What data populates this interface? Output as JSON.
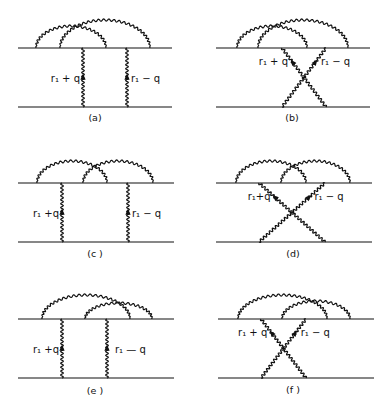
{
  "figure": {
    "panels": [
      {
        "id": "a",
        "caption": "(a)",
        "exchange": "direct",
        "label_left": "r₁ + q",
        "label_right": "r₁ − q",
        "arcs": "two nested overlapping arcs"
      },
      {
        "id": "b",
        "caption": "(b)",
        "exchange": "crossed",
        "label_left": "r₁ + q",
        "label_right": "r₁ − q",
        "arcs": "two nested overlapping arcs"
      },
      {
        "id": "c",
        "caption": "(c )",
        "exchange": "direct",
        "label_left": "r₁ +q",
        "label_right": "r₁ − q",
        "arcs": "two overlapping arcs side by side"
      },
      {
        "id": "d",
        "caption": "(d)",
        "exchange": "crossed",
        "label_left": "r₁+q",
        "label_right": "r₁ − q",
        "arcs": "two overlapping arcs side by side"
      },
      {
        "id": "e",
        "caption": "(e )",
        "exchange": "direct",
        "label_left": "r₁ +q",
        "label_right": "r₁ — q",
        "arcs": "two overlapping arcs, shifted right"
      },
      {
        "id": "f",
        "caption": "(f )",
        "exchange": "crossed",
        "label_left": "r₁ + q",
        "label_right": "r₁ − q",
        "arcs": "two overlapping arcs, shifted right"
      }
    ]
  }
}
